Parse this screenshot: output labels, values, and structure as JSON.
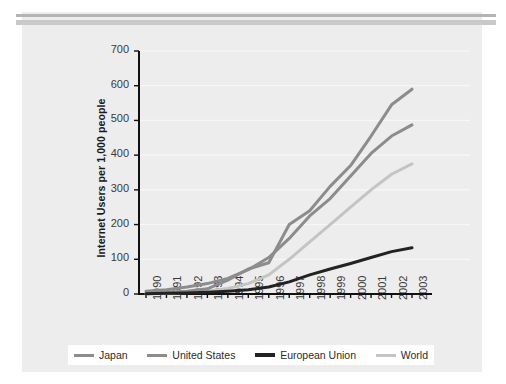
{
  "figure": {
    "panel_color": "#ededed",
    "rule_color_top": "#b4b4b4",
    "rule_color_second": "#c9c9c9"
  },
  "legend": {
    "items": [
      {
        "label": "Japan",
        "color": "#8c8c8c"
      },
      {
        "label": "United States",
        "color": "#8c8c8c"
      },
      {
        "label": "European Union",
        "color": "#222222"
      },
      {
        "label": "World",
        "color": "#c4c4c4"
      }
    ]
  },
  "chart_data": {
    "type": "line",
    "title": "",
    "xlabel": "",
    "ylabel": "Internet Users per 1,000 people",
    "categories": [
      "1990",
      "1991",
      "1992",
      "1993",
      "1994",
      "1995",
      "1996",
      "1997",
      "1998",
      "1999",
      "2000",
      "2001",
      "2002",
      "2003"
    ],
    "xlim": [
      "1990",
      "2003"
    ],
    "ylim": [
      0,
      700
    ],
    "yticks": [
      0,
      100,
      200,
      300,
      400,
      500,
      600,
      700
    ],
    "grid": true,
    "legend_position": "bottom",
    "series": [
      {
        "name": "Japan",
        "color": "#8c8c8c",
        "values": [
          2,
          4,
          8,
          15,
          40,
          72,
          90,
          200,
          240,
          310,
          370,
          455,
          545,
          590
        ]
      },
      {
        "name": "United States",
        "color": "#8c8c8c",
        "values": [
          8,
          12,
          20,
          30,
          45,
          70,
          105,
          160,
          225,
          275,
          340,
          405,
          455,
          487
        ]
      },
      {
        "name": "European Union",
        "color": "#222222",
        "values": [
          1,
          2,
          3,
          5,
          8,
          12,
          20,
          35,
          55,
          72,
          88,
          105,
          122,
          133
        ]
      },
      {
        "name": "World",
        "color": "#c4c4c4",
        "values": [
          1,
          2,
          4,
          8,
          16,
          30,
          55,
          100,
          150,
          200,
          250,
          300,
          345,
          375
        ]
      }
    ]
  }
}
